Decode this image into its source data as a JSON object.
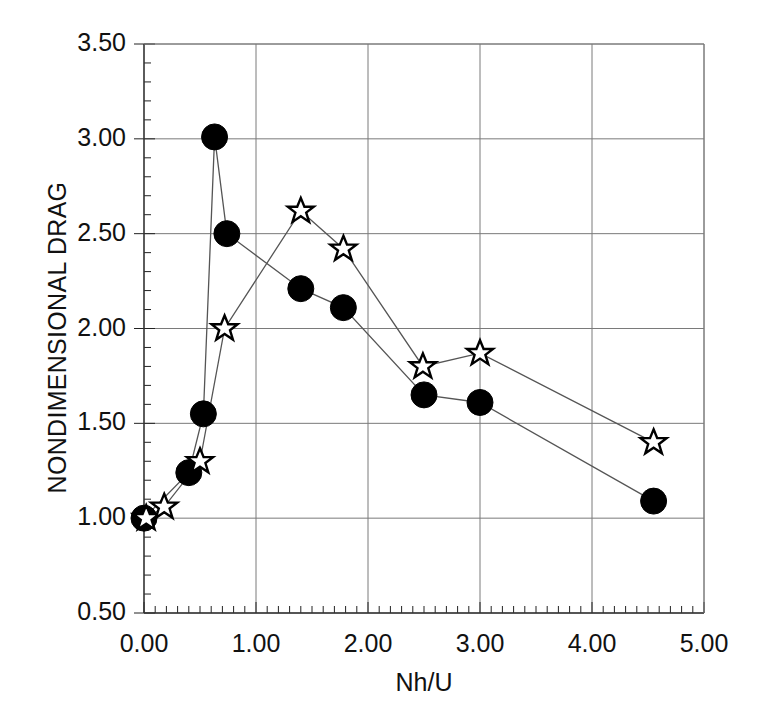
{
  "figure": {
    "top_caption_faint": "",
    "background_color": "#ffffff",
    "ink_color": "#111111",
    "gridline_color": "#7a7a7a"
  },
  "axes": {
    "xlabel": "Nh/U",
    "ylabel": "NONDIMENSIONAL DRAG",
    "xticks": [
      "0.00",
      "1.00",
      "2.00",
      "3.00",
      "4.00",
      "5.00"
    ],
    "yticks": [
      "0.50",
      "1.00",
      "1.50",
      "2.00",
      "2.50",
      "3.00",
      "3.50"
    ],
    "xlim": [
      0.0,
      5.0
    ],
    "ylim": [
      0.5,
      3.5
    ],
    "x_minor_per_major": 10,
    "y_minor_per_major": 5,
    "grid": "major gridlines on both axes"
  },
  "chart_data": {
    "type": "line",
    "title": "",
    "xlabel": "Nh/U",
    "ylabel": "NONDIMENSIONAL DRAG",
    "xlim": [
      0.0,
      5.0
    ],
    "ylim": [
      0.5,
      3.5
    ],
    "grid": true,
    "legend": "none",
    "series": [
      {
        "name": "circle-series",
        "marker": "filled-circle",
        "marker_color": "#000000",
        "line_color": "#555555",
        "points": [
          {
            "x": 0.0,
            "y": 1.0
          },
          {
            "x": 0.4,
            "y": 1.24
          },
          {
            "x": 0.53,
            "y": 1.55
          },
          {
            "x": 0.63,
            "y": 3.01
          },
          {
            "x": 0.74,
            "y": 2.5
          },
          {
            "x": 1.4,
            "y": 2.21
          },
          {
            "x": 1.78,
            "y": 2.11
          },
          {
            "x": 2.5,
            "y": 1.65
          },
          {
            "x": 3.0,
            "y": 1.61
          },
          {
            "x": 4.55,
            "y": 1.09
          }
        ]
      },
      {
        "name": "star-series",
        "marker": "open-star",
        "marker_color": "#ffffff",
        "marker_edge_color": "#000000",
        "line_color": "#555555",
        "points": [
          {
            "x": 0.02,
            "y": 1.0
          },
          {
            "x": 0.18,
            "y": 1.06
          },
          {
            "x": 0.5,
            "y": 1.3
          },
          {
            "x": 0.72,
            "y": 2.0
          },
          {
            "x": 1.4,
            "y": 2.62
          },
          {
            "x": 1.78,
            "y": 2.42
          },
          {
            "x": 2.49,
            "y": 1.8
          },
          {
            "x": 3.0,
            "y": 1.87
          },
          {
            "x": 4.55,
            "y": 1.4
          }
        ]
      }
    ]
  }
}
